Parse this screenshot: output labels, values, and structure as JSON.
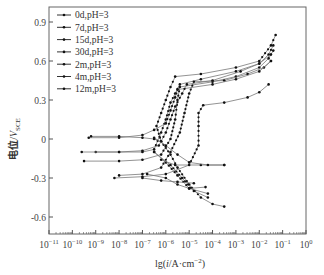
{
  "chart_data": {
    "type": "line",
    "title": "",
    "xlabel": "lg(i/A·cm⁻²)",
    "ylabel": "电位/V_SCE",
    "xscale": "log",
    "xlim": [
      1e-11,
      1
    ],
    "ylim": [
      -0.75,
      1.0
    ],
    "x_ticks": [
      "10⁻¹¹",
      "10⁻¹⁰",
      "10⁻⁹",
      "10⁻⁸",
      "10⁻⁷",
      "10⁻⁶",
      "10⁻⁵",
      "10⁻⁴",
      "10⁻³",
      "10⁻²",
      "10⁻¹",
      "10⁰"
    ],
    "x_tick_exponents": [
      -11,
      -10,
      -9,
      -8,
      -7,
      -6,
      -5,
      -4,
      -3,
      -2,
      -1,
      0
    ],
    "y_ticks": [
      0.9,
      0.6,
      0.3,
      0,
      -0.3,
      -0.6
    ],
    "y_tick_labels": [
      "0.9",
      "0.6",
      "0.3",
      "0",
      "-0.3",
      "-0.6"
    ],
    "grid": false,
    "legend_position": "upper left",
    "series": [
      {
        "name": "0d,pH=3",
        "points_log_i_E": [
          [
            -9.2,
            0.02
          ],
          [
            -8,
            0.02
          ],
          [
            -7,
            0.01
          ],
          [
            -6.5,
            0.0
          ],
          [
            -6.2,
            -0.02
          ],
          [
            -6.4,
            0.1
          ],
          [
            -6.2,
            0.2
          ],
          [
            -6.0,
            0.3
          ],
          [
            -5.8,
            0.4
          ],
          [
            -5.6,
            0.48
          ],
          [
            -4.5,
            0.5
          ],
          [
            -3,
            0.55
          ],
          [
            -2,
            0.6
          ],
          [
            -1.5,
            0.72
          ],
          [
            -1.3,
            0.8
          ]
        ],
        "cathodic_log_i_E": [
          [
            -6.2,
            -0.02
          ],
          [
            -5.8,
            -0.12
          ],
          [
            -5.5,
            -0.22
          ],
          [
            -5,
            -0.35
          ],
          [
            -4.5,
            -0.45
          ],
          [
            -4,
            -0.5
          ],
          [
            -3.5,
            -0.52
          ]
        ]
      },
      {
        "name": "7d,pH=3",
        "points_log_i_E": [
          [
            -9.0,
            -0.1
          ],
          [
            -8,
            -0.1
          ],
          [
            -7,
            -0.1
          ],
          [
            -6.5,
            -0.08
          ],
          [
            -6.2,
            0.05
          ],
          [
            -6,
            0.15
          ],
          [
            -5.8,
            0.28
          ],
          [
            -5.6,
            0.35
          ],
          [
            -5.4,
            0.42
          ],
          [
            -4.5,
            0.46
          ],
          [
            -3,
            0.52
          ],
          [
            -2,
            0.58
          ],
          [
            -1.6,
            0.65
          ],
          [
            -1.4,
            0.72
          ]
        ],
        "cathodic_log_i_E": [
          [
            -6.5,
            -0.1
          ],
          [
            -6,
            -0.18
          ],
          [
            -5.5,
            -0.28
          ],
          [
            -5,
            -0.38
          ],
          [
            -4.2,
            -0.42
          ]
        ]
      },
      {
        "name": "15d,pH=3",
        "points_log_i_E": [
          [
            -9.5,
            -0.17
          ],
          [
            -8,
            -0.17
          ],
          [
            -7,
            -0.16
          ],
          [
            -6.2,
            -0.12
          ],
          [
            -5.8,
            0.0
          ],
          [
            -5.6,
            0.15
          ],
          [
            -5.5,
            0.3
          ],
          [
            -5.4,
            0.4
          ],
          [
            -4,
            0.44
          ],
          [
            -3,
            0.48
          ],
          [
            -2,
            0.55
          ],
          [
            -1.6,
            0.62
          ],
          [
            -1.4,
            0.68
          ]
        ],
        "cathodic_log_i_E": [
          [
            -6.2,
            -0.16
          ],
          [
            -5.6,
            -0.2
          ],
          [
            -4.5,
            -0.2
          ],
          [
            -3.5,
            -0.2
          ]
        ]
      },
      {
        "name": "30d,pH=3",
        "points_log_i_E": [
          [
            -8.0,
            -0.28
          ],
          [
            -7,
            -0.27
          ],
          [
            -6.2,
            -0.22
          ],
          [
            -5.8,
            -0.1
          ],
          [
            -5.4,
            0.05
          ],
          [
            -5.2,
            0.2
          ],
          [
            -5.0,
            0.35
          ],
          [
            -4.8,
            0.44
          ],
          [
            -3.5,
            0.45
          ],
          [
            -2.5,
            0.5
          ],
          [
            -1.8,
            0.55
          ],
          [
            -1.5,
            0.6
          ]
        ],
        "cathodic_log_i_E": [
          [
            -6.8,
            -0.27
          ],
          [
            -6,
            -0.3
          ],
          [
            -5.5,
            -0.35
          ],
          [
            -5,
            -0.38
          ],
          [
            -4.3,
            -0.37
          ]
        ]
      },
      {
        "name": "2m,pH=3",
        "points_log_i_E": [
          [
            -8.2,
            -0.3
          ],
          [
            -7,
            -0.29
          ],
          [
            -6.0,
            -0.27
          ],
          [
            -5.0,
            -0.2
          ],
          [
            -4.6,
            -0.05
          ],
          [
            -4.6,
            0.1
          ],
          [
            -4.6,
            0.2
          ],
          [
            -4.4,
            0.26
          ],
          [
            -3.5,
            0.28
          ],
          [
            -2.5,
            0.32
          ],
          [
            -2,
            0.36
          ],
          [
            -1.6,
            0.42
          ]
        ],
        "cathodic_log_i_E": [
          [
            -7,
            -0.3
          ],
          [
            -6.2,
            -0.32
          ],
          [
            -5.5,
            -0.33
          ],
          [
            -4.8,
            -0.34
          ]
        ]
      },
      {
        "name": "4m,pH=3",
        "points_log_i_E": [
          [
            -9.3,
            0.01
          ],
          [
            -8,
            0.01
          ],
          [
            -7,
            0.03
          ],
          [
            -6.5,
            0.07
          ],
          [
            -6.0,
            0.12
          ],
          [
            -5.8,
            0.22
          ],
          [
            -5.6,
            0.32
          ],
          [
            -5.5,
            0.38
          ],
          [
            -4,
            0.42
          ],
          [
            -3,
            0.46
          ],
          [
            -2,
            0.52
          ],
          [
            -1.5,
            0.6
          ]
        ],
        "cathodic_log_i_E": [
          [
            -6.5,
            0.01
          ],
          [
            -6,
            -0.05
          ],
          [
            -5.5,
            -0.12
          ],
          [
            -5,
            -0.18
          ],
          [
            -4.2,
            -0.2
          ],
          [
            -3.5,
            -0.2
          ]
        ]
      },
      {
        "name": "12m,pH=3",
        "points_log_i_E": [
          [
            -9.6,
            -0.1
          ],
          [
            -8,
            -0.1
          ],
          [
            -7,
            -0.09
          ],
          [
            -6.3,
            -0.05
          ],
          [
            -6.0,
            0.05
          ],
          [
            -5.8,
            0.15
          ],
          [
            -5.6,
            0.25
          ],
          [
            -5.3,
            0.35
          ],
          [
            -5.1,
            0.42
          ],
          [
            -4,
            0.45
          ],
          [
            -2.8,
            0.52
          ],
          [
            -2,
            0.58
          ],
          [
            -1.5,
            0.65
          ]
        ],
        "cathodic_log_i_E": [
          [
            -6.5,
            -0.1
          ],
          [
            -5.8,
            -0.2
          ],
          [
            -5.3,
            -0.3
          ],
          [
            -4.8,
            -0.4
          ],
          [
            -4.2,
            -0.45
          ]
        ]
      }
    ]
  },
  "legend": [
    {
      "label": "0d,pH=3"
    },
    {
      "label": "7d,pH=3"
    },
    {
      "label": "15d,pH=3"
    },
    {
      "label": "30d,pH=3"
    },
    {
      "label": "2m,pH=3"
    },
    {
      "label": "4m,pH=3"
    },
    {
      "label": "12m,pH=3"
    }
  ],
  "axes": {
    "ylabel_main": "电位/",
    "ylabel_var": "V",
    "ylabel_sub": "SCE",
    "xlabel_pre": "lg(",
    "xlabel_var": "i",
    "xlabel_post": "/A·cm",
    "xlabel_sup": "−2",
    "xlabel_close": ")"
  },
  "colors": {
    "axis": "#555555",
    "curve": "#777777",
    "marker": "#111111"
  }
}
